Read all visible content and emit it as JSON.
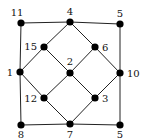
{
  "diagram": {
    "nodes": [
      {
        "id": "n11",
        "label": "11",
        "x": 21,
        "y": 23,
        "lx": 17,
        "ly": 16,
        "anchor": "middle"
      },
      {
        "id": "n4",
        "label": "4",
        "x": 70,
        "y": 22,
        "lx": 70,
        "ly": 15,
        "anchor": "middle"
      },
      {
        "id": "n5t",
        "label": "5",
        "x": 120,
        "y": 24,
        "lx": 120,
        "ly": 17,
        "anchor": "middle"
      },
      {
        "id": "n15",
        "label": "15",
        "x": 44,
        "y": 47,
        "lx": 37,
        "ly": 50,
        "anchor": "end"
      },
      {
        "id": "n6",
        "label": "6",
        "x": 95,
        "y": 47,
        "lx": 102,
        "ly": 51,
        "anchor": "start"
      },
      {
        "id": "n1",
        "label": "1",
        "x": 20,
        "y": 72,
        "lx": 13,
        "ly": 76,
        "anchor": "end"
      },
      {
        "id": "n2",
        "label": "2",
        "x": 70,
        "y": 73,
        "lx": 70,
        "ly": 65,
        "anchor": "middle"
      },
      {
        "id": "n10",
        "label": "10",
        "x": 120,
        "y": 73,
        "lx": 127,
        "ly": 77,
        "anchor": "start"
      },
      {
        "id": "n12",
        "label": "12",
        "x": 44,
        "y": 98,
        "lx": 37,
        "ly": 102,
        "anchor": "end"
      },
      {
        "id": "n3",
        "label": "3",
        "x": 95,
        "y": 98,
        "lx": 102,
        "ly": 102,
        "anchor": "start"
      },
      {
        "id": "n8",
        "label": "8",
        "x": 21,
        "y": 125,
        "lx": 21,
        "ly": 138,
        "anchor": "middle"
      },
      {
        "id": "n7",
        "label": "7",
        "x": 70,
        "y": 124,
        "lx": 70,
        "ly": 138,
        "anchor": "middle"
      },
      {
        "id": "n5b",
        "label": "5",
        "x": 120,
        "y": 125,
        "lx": 120,
        "ly": 138,
        "anchor": "middle"
      }
    ],
    "edges": [
      [
        "n11",
        "n4"
      ],
      [
        "n4",
        "n5t"
      ],
      [
        "n11",
        "n1"
      ],
      [
        "n1",
        "n8"
      ],
      [
        "n5t",
        "n10"
      ],
      [
        "n10",
        "n5b"
      ],
      [
        "n8",
        "n7"
      ],
      [
        "n7",
        "n5b"
      ],
      [
        "n4",
        "n15"
      ],
      [
        "n15",
        "n1"
      ],
      [
        "n4",
        "n6"
      ],
      [
        "n6",
        "n10"
      ],
      [
        "n15",
        "n2"
      ],
      [
        "n2",
        "n6"
      ],
      [
        "n1",
        "n12"
      ],
      [
        "n12",
        "n7"
      ],
      [
        "n2",
        "n12"
      ],
      [
        "n2",
        "n3"
      ],
      [
        "n10",
        "n3"
      ],
      [
        "n3",
        "n7"
      ]
    ]
  }
}
